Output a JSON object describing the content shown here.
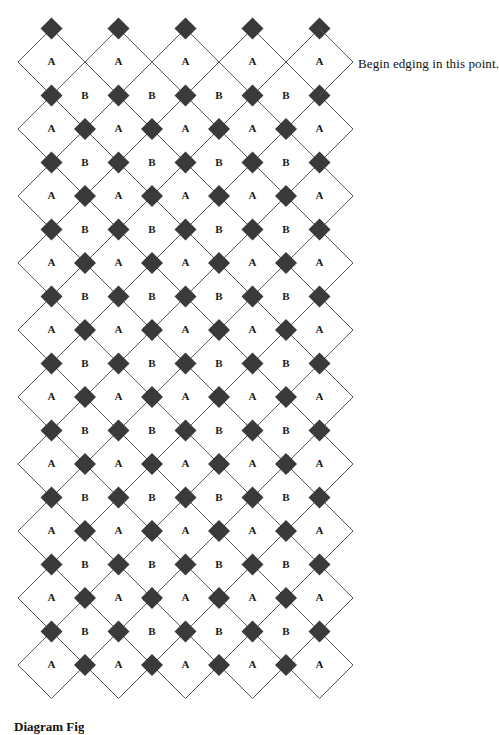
{
  "figure": {
    "type": "diagram",
    "kind": "diamond-lattice-pattern-chart",
    "background_color": "#ffffff",
    "line_color": "#55555c",
    "bead_color": "#3a3a3a",
    "label_color": "#1a1a1a"
  },
  "lattice": {
    "pitch": 67,
    "half_pitch": 33.5,
    "origin_x": 18,
    "origin_y": 62,
    "right_edge_x": 353,
    "a_columns": 5,
    "a_rows": 10,
    "b_columns": 4,
    "b_rows": 9,
    "bead_size": 22,
    "a_label": "A",
    "b_label": "B",
    "a_row_centers_y": [
      62,
      129,
      196,
      263,
      330,
      397,
      464,
      531,
      598,
      665
    ],
    "a_col_centers_x": [
      51.5,
      118.5,
      185.5,
      252.5,
      319.5
    ],
    "b_row_centers_y": [
      95.5,
      162.5,
      229.5,
      296.5,
      363.5,
      430.5,
      497.5,
      564.5,
      631.5
    ],
    "b_col_centers_x": [
      85,
      152,
      219,
      286
    ]
  },
  "annotation": {
    "text": "Begin edging in this point.",
    "x": 358,
    "y": 56,
    "target_vertex_x": 353,
    "target_vertex_y": 62
  },
  "caption": {
    "text": "Diagram    Fig",
    "x": 14,
    "y": 719,
    "clipped": true
  }
}
